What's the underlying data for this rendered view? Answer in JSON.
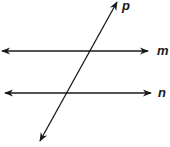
{
  "diagram": {
    "lines": [
      {
        "id": "m",
        "label": "m",
        "type": "double-arrow",
        "x1": 2,
        "y1": 51,
        "x2": 148,
        "y2": 51,
        "label_x": 158,
        "label_y": 45
      },
      {
        "id": "n",
        "label": "n",
        "type": "double-arrow",
        "x1": 5,
        "y1": 93,
        "x2": 151,
        "y2": 93,
        "label_x": 158,
        "label_y": 87
      },
      {
        "id": "p",
        "label": "p",
        "type": "double-arrow",
        "x1": 40,
        "y1": 141,
        "x2": 117,
        "y2": 2,
        "label_x": 122,
        "label_y": -2
      }
    ],
    "stroke_color": "#1a1a1a"
  }
}
